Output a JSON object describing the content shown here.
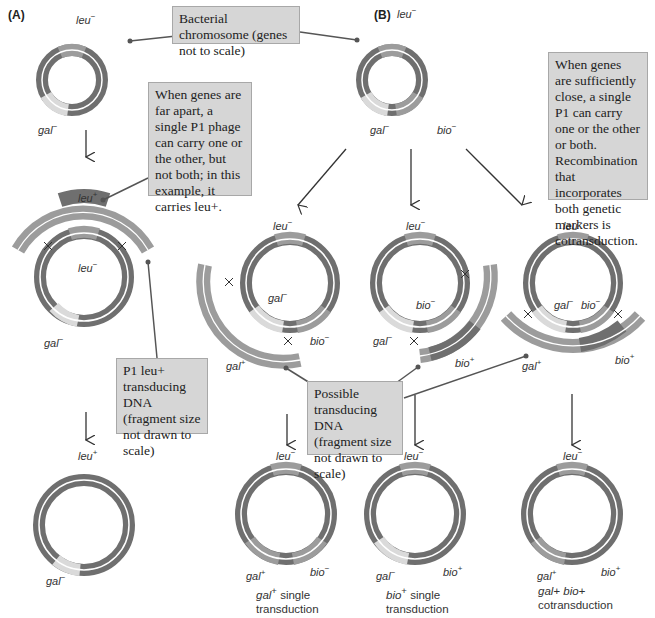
{
  "panels": {
    "a_label": "(A)",
    "b_label": "(B)"
  },
  "callouts": {
    "chromosome": "Bacterial chromosome (genes not to scale)",
    "far_apart": "When genes are far apart, a single P1 phage can carry one or the other, but not both; in this example, it carries leu+.",
    "close": "When genes are sufficiently close, a single P1 can carry one or the other or both. Recombination that incorporates both genetic markers is cotransduction.",
    "p1_leu": "P1 leu+ transducing DNA (fragment size not drawn to scale)",
    "possible": "Possible transducing DNA (fragment size not drawn to scale)"
  },
  "genes": {
    "leu_minus": "leu",
    "leu_plus": "leu",
    "gal_minus": "gal",
    "gal_plus": "gal",
    "bio_minus": "bio",
    "bio_plus": "bio",
    "minus": "−",
    "plus": "+"
  },
  "outcomes": [
    {
      "marker": "gal",
      "sign": "+",
      "text": "single",
      "line2": "transduction"
    },
    {
      "marker": "bio",
      "sign": "+",
      "text": "single",
      "line2": "transduction"
    },
    {
      "marker": "gal+ bio+",
      "sign": "",
      "text": "",
      "line2": "cotransduction"
    }
  ],
  "colors": {
    "dark": "#6f6f6f",
    "medium": "#9c9c9c",
    "light": "#dadada",
    "box": "#d6d6d6",
    "line": "#555555"
  }
}
